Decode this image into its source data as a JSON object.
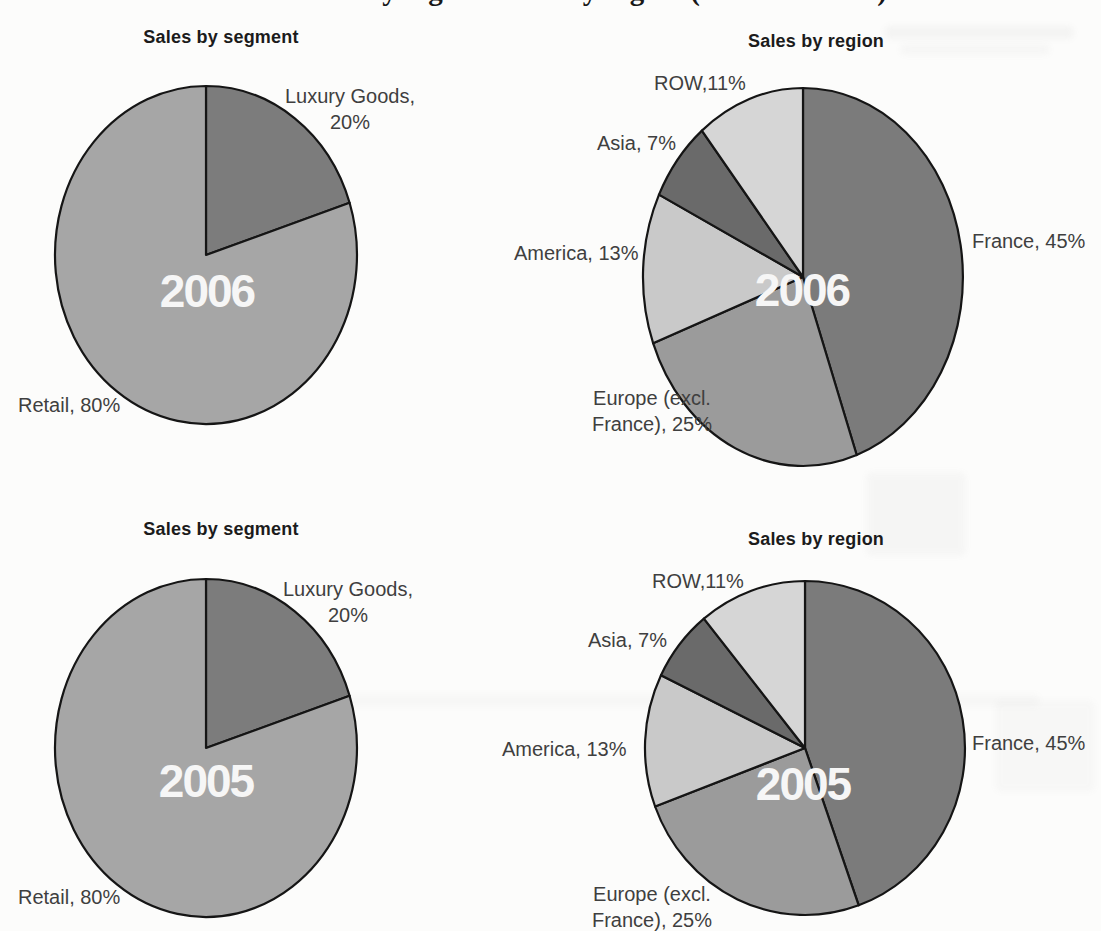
{
  "page": {
    "cropped_heading_text": "Sales by segment and by region (2005 and 2006)"
  },
  "chart_data": [
    {
      "type": "pie",
      "position": "top-left",
      "title": "Sales by segment",
      "center_label": "2006",
      "categories": [
        "Luxury Goods",
        "Retail"
      ],
      "values": [
        20,
        80
      ],
      "legend_position": "none",
      "slices": [
        {
          "name": "Luxury Goods",
          "value": 20,
          "color": "#7c7c7c",
          "label_lines": [
            "Luxury Goods,",
            "20%"
          ]
        },
        {
          "name": "Retail",
          "value": 80,
          "color": "#a6a6a6",
          "label_lines": [
            "Retail, 80%"
          ]
        }
      ]
    },
    {
      "type": "pie",
      "position": "top-right",
      "title": "Sales by region",
      "center_label": "2006",
      "categories": [
        "France",
        "Europe (excl. France)",
        "America",
        "Asia",
        "ROW"
      ],
      "values": [
        45,
        25,
        13,
        7,
        11
      ],
      "legend_position": "none",
      "slices": [
        {
          "name": "France",
          "value": 45,
          "color": "#7b7b7b",
          "label_lines": [
            "France, 45%"
          ]
        },
        {
          "name": "Europe (excl. France)",
          "value": 25,
          "color": "#9b9b9b",
          "label_lines": [
            "Europe (excl.",
            "France), 25%"
          ]
        },
        {
          "name": "America",
          "value": 13,
          "color": "#c9c9c9",
          "label_lines": [
            "America, 13%"
          ]
        },
        {
          "name": "Asia",
          "value": 7,
          "color": "#6a6a6a",
          "label_lines": [
            "Asia, 7%"
          ]
        },
        {
          "name": "ROW",
          "value": 11,
          "color": "#d6d6d6",
          "label_lines": [
            "ROW,11%"
          ]
        }
      ]
    },
    {
      "type": "pie",
      "position": "bottom-left",
      "title": "Sales by segment",
      "center_label": "2005",
      "categories": [
        "Luxury Goods",
        "Retail"
      ],
      "values": [
        20,
        80
      ],
      "legend_position": "none",
      "slices": [
        {
          "name": "Luxury Goods",
          "value": 20,
          "color": "#7c7c7c",
          "label_lines": [
            "Luxury Goods,",
            "20%"
          ]
        },
        {
          "name": "Retail",
          "value": 80,
          "color": "#a6a6a6",
          "label_lines": [
            "Retail, 80%"
          ]
        }
      ]
    },
    {
      "type": "pie",
      "position": "bottom-right",
      "title": "Sales by region",
      "center_label": "2005",
      "categories": [
        "France",
        "Europe (excl. France)",
        "America",
        "Asia",
        "ROW"
      ],
      "values": [
        45,
        25,
        13,
        7,
        11
      ],
      "legend_position": "none",
      "slices": [
        {
          "name": "France",
          "value": 45,
          "color": "#7b7b7b",
          "label_lines": [
            "France, 45%"
          ]
        },
        {
          "name": "Europe (excl. France)",
          "value": 25,
          "color": "#9b9b9b",
          "label_lines": [
            "Europe (excl.",
            "France), 25%"
          ]
        },
        {
          "name": "America",
          "value": 13,
          "color": "#c9c9c9",
          "label_lines": [
            "America, 13%"
          ]
        },
        {
          "name": "Asia",
          "value": 7,
          "color": "#6a6a6a",
          "label_lines": [
            "Asia, 7%"
          ]
        },
        {
          "name": "ROW",
          "value": 11,
          "color": "#d6d6d6",
          "label_lines": [
            "ROW,11%"
          ]
        }
      ]
    }
  ]
}
